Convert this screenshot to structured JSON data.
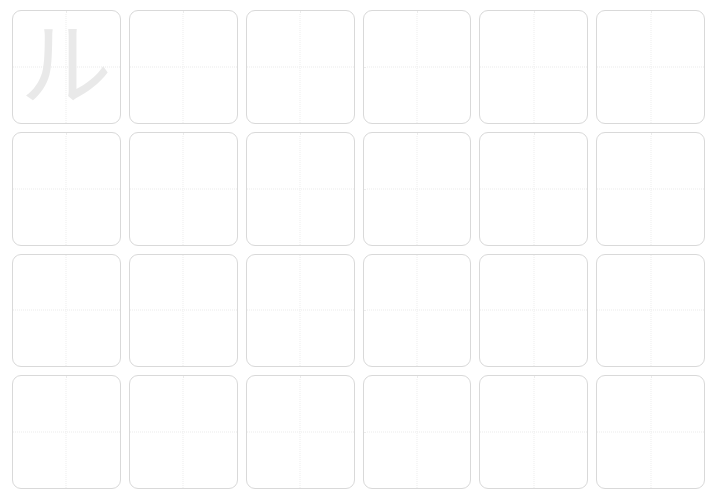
{
  "worksheet": {
    "title": "Character Tracing Practice Sheet",
    "background_color": "#ffffff",
    "columns": 6,
    "rows": 4,
    "cell": {
      "border_color": "#d9d9d9",
      "border_radius_px": 9,
      "guide_line_color": "#ececec",
      "guide_line_style": "dotted",
      "guides": [
        "vertical-center",
        "horizontal-center"
      ]
    },
    "glyph": {
      "character": "ル",
      "color": "#e9e9e9",
      "reading": "ru",
      "script": "katakana"
    },
    "cells": [
      {
        "row": 1,
        "col": 1,
        "character": "ル",
        "filled": true
      },
      {
        "row": 1,
        "col": 2,
        "character": "",
        "filled": false
      },
      {
        "row": 1,
        "col": 3,
        "character": "",
        "filled": false
      },
      {
        "row": 1,
        "col": 4,
        "character": "",
        "filled": false
      },
      {
        "row": 1,
        "col": 5,
        "character": "",
        "filled": false
      },
      {
        "row": 1,
        "col": 6,
        "character": "",
        "filled": false
      },
      {
        "row": 2,
        "col": 1,
        "character": "",
        "filled": false
      },
      {
        "row": 2,
        "col": 2,
        "character": "",
        "filled": false
      },
      {
        "row": 2,
        "col": 3,
        "character": "",
        "filled": false
      },
      {
        "row": 2,
        "col": 4,
        "character": "",
        "filled": false
      },
      {
        "row": 2,
        "col": 5,
        "character": "",
        "filled": false
      },
      {
        "row": 2,
        "col": 6,
        "character": "",
        "filled": false
      },
      {
        "row": 3,
        "col": 1,
        "character": "",
        "filled": false
      },
      {
        "row": 3,
        "col": 2,
        "character": "",
        "filled": false
      },
      {
        "row": 3,
        "col": 3,
        "character": "",
        "filled": false
      },
      {
        "row": 3,
        "col": 4,
        "character": "",
        "filled": false
      },
      {
        "row": 3,
        "col": 5,
        "character": "",
        "filled": false
      },
      {
        "row": 3,
        "col": 6,
        "character": "",
        "filled": false
      },
      {
        "row": 4,
        "col": 1,
        "character": "",
        "filled": false
      },
      {
        "row": 4,
        "col": 2,
        "character": "",
        "filled": false
      },
      {
        "row": 4,
        "col": 3,
        "character": "",
        "filled": false
      },
      {
        "row": 4,
        "col": 4,
        "character": "",
        "filled": false
      },
      {
        "row": 4,
        "col": 5,
        "character": "",
        "filled": false
      },
      {
        "row": 4,
        "col": 6,
        "character": "",
        "filled": false
      }
    ]
  }
}
